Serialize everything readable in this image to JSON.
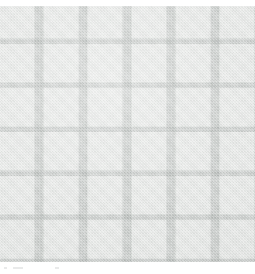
{
  "image": {
    "subject": "fabric-swatch",
    "description": "Light grey woven textile swatch with a windowpane / check grid pattern",
    "width": 255,
    "height": 274,
    "background_color": "#ffffff"
  },
  "swatch": {
    "name": "windowpane-check-fabric",
    "material": "woven-cloth",
    "weave": "twill",
    "region": {
      "x": 0,
      "y": 6,
      "width": 255,
      "height": 256
    },
    "colors": {
      "cell": "#e4e6e4",
      "grid_line": "#c3c7c5",
      "intersection": "#bcc1bf",
      "background": "#ffffff"
    },
    "grid": {
      "pattern": "windowpane",
      "vertical_period_px": 44,
      "horizontal_period_px": 44,
      "line_width_px": 10,
      "vertical_line_positions": [
        34,
        78,
        122,
        166,
        210
      ],
      "horizontal_line_positions": [
        38,
        82,
        126,
        170,
        214
      ],
      "columns": 6,
      "rows": 6
    }
  },
  "bottom_strip": {
    "name": "caption-remnant",
    "region": {
      "x": 0,
      "y": 262,
      "width": 255,
      "height": 12
    },
    "color": "#ffffff",
    "marks": [
      {
        "x": 4,
        "y": 267,
        "width": 3,
        "color": "#e9eaea"
      },
      {
        "x": 13,
        "y": 267,
        "width": 10,
        "color": "#e9eaea"
      },
      {
        "x": 55,
        "y": 267,
        "width": 4,
        "color": "#e9eaea"
      }
    ]
  }
}
